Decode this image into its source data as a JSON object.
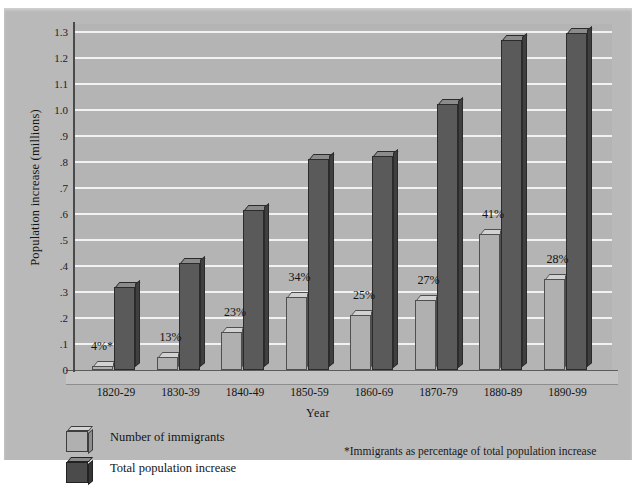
{
  "chart_data": {
    "type": "bar",
    "title": "",
    "xlabel": "Year",
    "ylabel": "Population increase (millions)",
    "categories": [
      "1820-29",
      "1830-39",
      "1840-49",
      "1850-59",
      "1860-69",
      "1870-79",
      "1880-89",
      "1890-99"
    ],
    "series": [
      {
        "name": "Number of immigrants",
        "color": "#b0b0b0",
        "values": [
          0.015,
          0.05,
          0.145,
          0.28,
          0.21,
          0.27,
          0.525,
          0.35
        ]
      },
      {
        "name": "Total population increase",
        "color": "#5a5a5a",
        "values": [
          0.32,
          0.41,
          0.615,
          0.81,
          0.825,
          1.025,
          1.27,
          1.295
        ]
      }
    ],
    "annotations": [
      "4%*",
      "13%",
      "23%",
      "34%",
      "25%",
      "27%",
      "41%",
      "28%"
    ],
    "ylim": [
      0,
      1.35
    ],
    "yticks": [
      "0",
      ".1",
      ".2",
      ".3",
      ".4",
      ".5",
      ".6",
      ".7",
      ".8",
      ".9",
      "1.0",
      "1.1",
      "1.2",
      "1.3"
    ],
    "ytick_values": [
      0,
      0.1,
      0.2,
      0.3,
      0.4,
      0.5,
      0.6,
      0.7,
      0.8,
      0.9,
      1.0,
      1.1,
      1.2,
      1.3
    ],
    "grid": true,
    "legend_position": "bottom-left"
  },
  "legend": {
    "items": [
      {
        "label": "Number of immigrants"
      },
      {
        "label": "Total population increase"
      }
    ]
  },
  "footnote": "*Immigrants as percentage of total population increase"
}
